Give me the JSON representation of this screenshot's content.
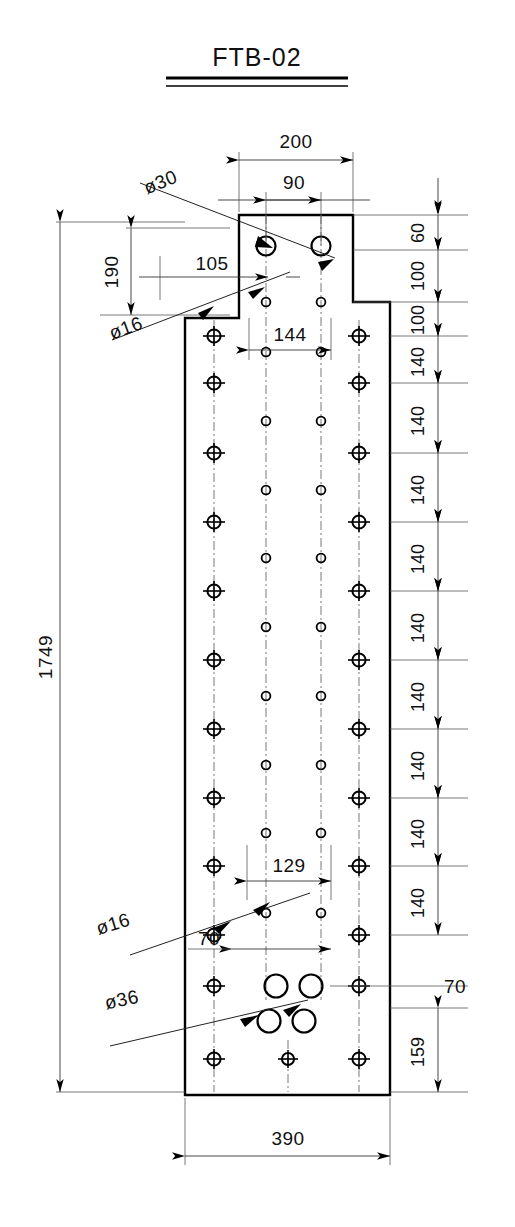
{
  "title": {
    "label": "FTB-02"
  },
  "units": "mm",
  "drawing": {
    "name": "front-elevation-plate",
    "overall_height": "1749",
    "overall_width": "390"
  },
  "dimensions": {
    "top": {
      "outer": "200",
      "inner": "90"
    },
    "left": {
      "total": "1749",
      "flange_drop": "190",
      "offset": "105"
    },
    "right_chain": [
      "60",
      "100",
      "100",
      "140",
      "140",
      "140",
      "140",
      "140",
      "140",
      "140",
      "140",
      "140",
      "70",
      "159"
    ],
    "interior": {
      "upper_spacing": "144",
      "lower_spacing": "129",
      "edge_offset": "70"
    },
    "bottom": {
      "width": "390"
    }
  },
  "callouts": [
    {
      "name": "dia-30-callout",
      "label": "ø30"
    },
    {
      "name": "dia-16-callout-top",
      "label": "ø16"
    },
    {
      "name": "dia-16-callout-bottom",
      "label": "ø16"
    },
    {
      "name": "dia-36-callout",
      "label": "ø36"
    }
  ],
  "colors": {
    "line": "#000000",
    "thin_line": "#3a3a3a",
    "background": "#ffffff"
  }
}
